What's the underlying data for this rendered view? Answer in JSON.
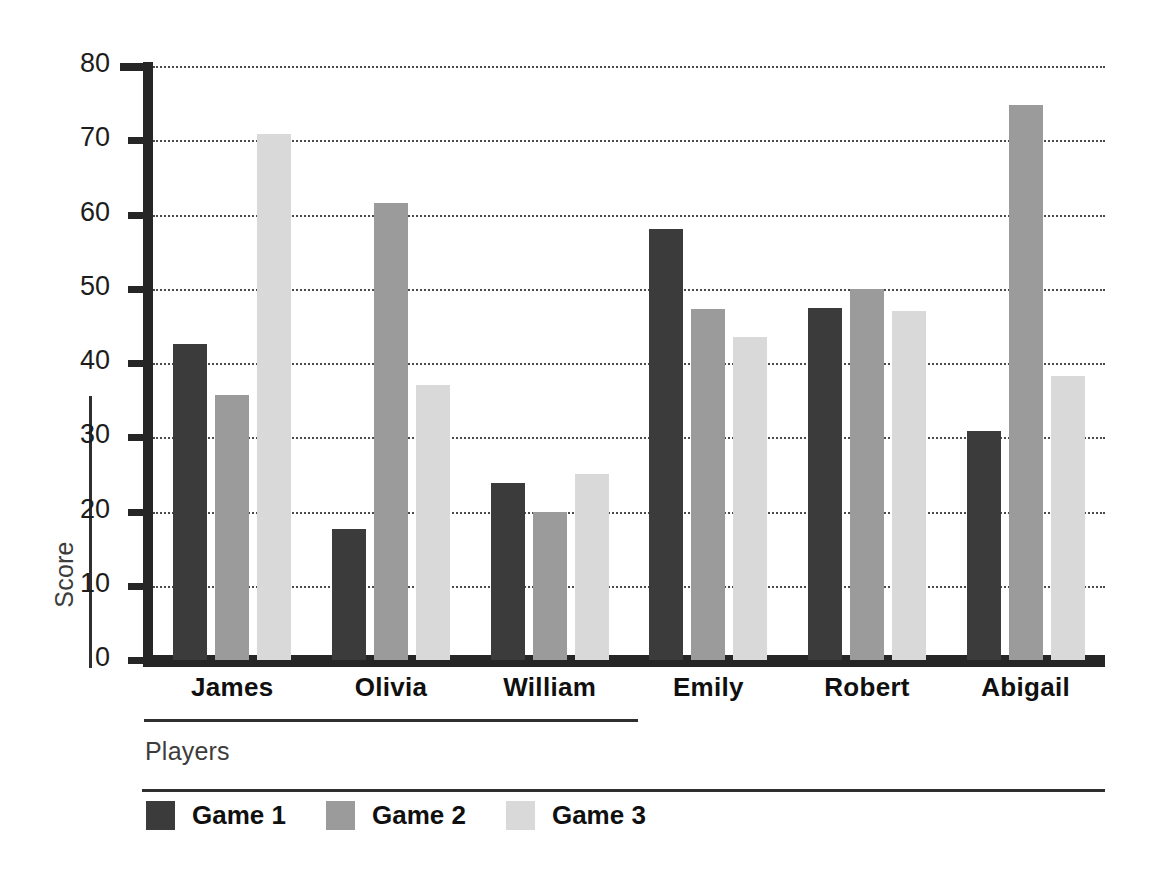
{
  "chart_data": {
    "type": "bar",
    "title": "",
    "subtitle": "",
    "xlabel": "Players",
    "ylabel": "Score",
    "categories": [
      "James",
      "Olivia",
      "William",
      "Emily",
      "Robert",
      "Abigail"
    ],
    "series": [
      {
        "name": "Game 1",
        "color": "#3b3b3b",
        "values": [
          42.5,
          17.6,
          23.8,
          58.1,
          47.4,
          30.8
        ]
      },
      {
        "name": "Game 2",
        "color": "#9b9b9b",
        "values": [
          35.7,
          61.5,
          19.9,
          47.3,
          50.0,
          74.7
        ]
      },
      {
        "name": "Game 3",
        "color": "#d9d9d9",
        "values": [
          70.8,
          37.1,
          25.1,
          43.5,
          47.0,
          38.2
        ]
      }
    ],
    "ylim": [
      0,
      80
    ],
    "yticks": [
      0,
      10,
      20,
      30,
      40,
      50,
      60,
      70,
      80
    ],
    "ytick_labels": [
      "0",
      "10",
      "20",
      "30",
      "40",
      "50",
      "60",
      "70",
      "80"
    ],
    "grid": "horizontal-dotted",
    "legend_position": "bottom-left",
    "orientation": "vertical",
    "grouping": "grouped"
  },
  "axes": {
    "y_title": "Score",
    "x_title": "Players"
  },
  "legend": {
    "entries": [
      {
        "label": "Game 1",
        "color": "#3b3b3b"
      },
      {
        "label": "Game 2",
        "color": "#9b9b9b"
      },
      {
        "label": "Game 3",
        "color": "#d9d9d9"
      }
    ]
  }
}
